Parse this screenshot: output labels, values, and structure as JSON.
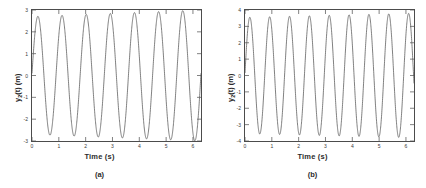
{
  "figure": {
    "background": "#ffffff",
    "axis_color": "#4c4c4c",
    "line_color": "#555555"
  },
  "panels": [
    {
      "caption": "(a)",
      "ylabel_main": "y",
      "ylabel_sub": "2",
      "ylabel_rest": "(t) (m)",
      "ylabel_full": "y2(t) (m)",
      "xlabel": "Time (s)",
      "yticks": [
        "3",
        "2",
        "1",
        "0",
        "-1",
        "-2",
        "-3"
      ],
      "xticks": [
        "0",
        "1",
        "2",
        "3",
        "4",
        "5",
        "6"
      ]
    },
    {
      "caption": "(b)",
      "ylabel_main": "y",
      "ylabel_sub": "2",
      "ylabel_rest": "(t) (m)",
      "ylabel_full": "y2(t) (m)",
      "xlabel": "Time (s)",
      "yticks": [
        "4",
        "3",
        "2",
        "1",
        "0",
        "-1",
        "-2",
        "-3",
        "-4"
      ],
      "xticks": [
        "0",
        "1",
        "2",
        "3",
        "4",
        "5",
        "6"
      ]
    }
  ],
  "chart_data": [
    {
      "type": "line",
      "title": "",
      "subtitle": "(a)",
      "xlabel": "Time (s)",
      "ylabel": "y2(t) (m)",
      "xlim": [
        0,
        6.3
      ],
      "ylim": [
        -3,
        3
      ],
      "xticks": [
        0,
        1,
        2,
        3,
        4,
        5,
        6
      ],
      "yticks": [
        -3,
        -2,
        -1,
        0,
        1,
        2,
        3
      ],
      "grid": false,
      "legend": null,
      "series": [
        {
          "name": "y2",
          "description": "Growing-amplitude sinusoid, ~7 cycles over 0 to 6.3 s, period about 0.9 s, amplitude rising from about 2.7 to about 3.0, starting near 0.8 m at t=0",
          "amplitude_start": 2.7,
          "amplitude_end": 3.0,
          "period": 0.9,
          "cycles": 7,
          "y_at_t0": 0.8,
          "first_peak_t": 0.22,
          "first_peak_y": 2.72,
          "first_trough_t": 0.68,
          "first_trough_y": -2.78,
          "peaks_t": [
            0.22,
            1.13,
            2.05,
            2.96,
            3.88,
            4.79,
            5.71
          ],
          "peaks_y": [
            2.72,
            2.76,
            2.8,
            2.85,
            2.9,
            2.95,
            2.98
          ],
          "troughs_t": [
            0.68,
            1.59,
            2.51,
            3.42,
            4.34,
            5.25,
            6.17
          ],
          "troughs_y": [
            -2.74,
            -2.78,
            -2.82,
            -2.87,
            -2.92,
            -2.96,
            -3.0
          ]
        }
      ]
    },
    {
      "type": "line",
      "title": "",
      "subtitle": "(b)",
      "xlabel": "Time (s)",
      "ylabel": "y2(t) (m)",
      "xlim": [
        0,
        6.3
      ],
      "ylim": [
        -4,
        4
      ],
      "xticks": [
        0,
        1,
        2,
        3,
        4,
        5,
        6
      ],
      "yticks": [
        -4,
        -3,
        -2,
        -1,
        0,
        1,
        2,
        3,
        4
      ],
      "grid": false,
      "legend": null,
      "series": [
        {
          "name": "y2",
          "description": "Growing-amplitude sinusoid, about 8.5 cycles over 0 to 6.3 s, period about 0.74 s, amplitude rising from about 3.55 to about 3.8, starting near 1.0 m at t=0",
          "amplitude_start": 3.55,
          "amplitude_end": 3.8,
          "period": 0.74,
          "cycles": 8.5,
          "y_at_t0": 1.0,
          "first_peak_t": 0.18,
          "first_peak_y": 3.56,
          "first_trough_t": 0.55,
          "first_trough_y": -3.58,
          "peaks_t": [
            0.18,
            0.92,
            1.66,
            2.4,
            3.14,
            3.88,
            4.62,
            5.36,
            6.1
          ],
          "peaks_y": [
            3.56,
            3.59,
            3.62,
            3.65,
            3.69,
            3.72,
            3.75,
            3.78,
            3.8
          ],
          "troughs_t": [
            0.55,
            1.29,
            2.03,
            2.77,
            3.51,
            4.25,
            4.99,
            5.73
          ],
          "troughs_y": [
            -3.57,
            -3.6,
            -3.63,
            -3.67,
            -3.7,
            -3.74,
            -3.77,
            -3.79
          ]
        }
      ]
    }
  ]
}
